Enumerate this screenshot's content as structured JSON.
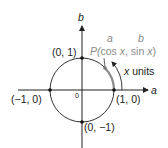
{
  "diagram": {
    "type": "unit-circle",
    "axes": {
      "horizontal_label": "a",
      "vertical_label": "b",
      "origin_label": "0"
    },
    "points": [
      {
        "label": "(0, 1)"
      },
      {
        "label": "(1, 0)"
      },
      {
        "label": "(−1, 0)"
      },
      {
        "label": "(0, −1)"
      }
    ],
    "point_p": {
      "prefix": "P(",
      "cos": "cos ",
      "x1": "x",
      "sep": ", sin ",
      "x2": "x",
      "suffix": ")",
      "annot_a": "a",
      "annot_b": "b"
    },
    "arc_label": {
      "x": "x",
      "units": " units"
    },
    "colors": {
      "line": "#222222",
      "gray": "#8a8a8a"
    }
  }
}
